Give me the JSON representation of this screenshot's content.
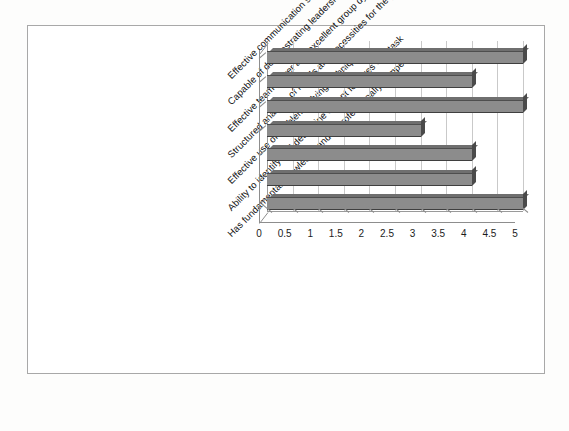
{
  "chart_data": {
    "type": "bar",
    "orientation": "horizontal",
    "style": "3d",
    "title": "",
    "subtitle": "",
    "xlabel": "",
    "ylabel": "",
    "categories": [
      "Effective communication skills: Visual, Verbal and Vocal",
      "Capable of demonstrating leadership qualities when needed",
      "Effective team player and excellent group dyanamics",
      "Structured analysis of needs and necessities for the project",
      "Effective use of problem solving techniques",
      "Ability to identify and determine salient features of a task",
      "Has fundamental knowledge and is professionally competent"
    ],
    "values": [
      5,
      4,
      5,
      3,
      4,
      4,
      5
    ],
    "xlim": [
      0,
      5
    ],
    "xticks": [
      0,
      0.5,
      1,
      1.5,
      2,
      2.5,
      3,
      3.5,
      4,
      4.5,
      5
    ],
    "xtick_labels": [
      "0",
      "0.5",
      "1",
      "1.5",
      "2",
      "2.5",
      "3",
      "3.5",
      "4",
      "4.5",
      "5"
    ],
    "grid": true,
    "grid_axis": "x",
    "legend": false,
    "bar_color": "#8c8c8c",
    "bar_edge_color": "#4a4a4a",
    "grid_color": "#c9c9c9",
    "axis_color": "#8d8d8d",
    "background_color": "#ffffff",
    "border_color": "#a8a8a8"
  }
}
